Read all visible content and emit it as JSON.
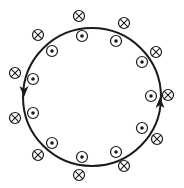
{
  "diagram": {
    "loop": {
      "cx": 92,
      "cy": 97,
      "r": 69,
      "color": "#1a1a1a"
    },
    "arrows": [
      {
        "x": 24,
        "y": 91,
        "direction": "down"
      },
      {
        "x": 160,
        "y": 103,
        "direction": "up"
      }
    ],
    "field_out_of_page": [
      {
        "x": 82,
        "y": 36
      },
      {
        "x": 116,
        "y": 41
      },
      {
        "x": 52,
        "y": 51
      },
      {
        "x": 142,
        "y": 62
      },
      {
        "x": 33,
        "y": 79
      },
      {
        "x": 151,
        "y": 96
      },
      {
        "x": 33,
        "y": 113
      },
      {
        "x": 142,
        "y": 128
      },
      {
        "x": 52,
        "y": 143
      },
      {
        "x": 116,
        "y": 152
      },
      {
        "x": 82,
        "y": 157
      }
    ],
    "field_into_page": [
      {
        "x": 79,
        "y": 16
      },
      {
        "x": 124,
        "y": 23
      },
      {
        "x": 38,
        "y": 35
      },
      {
        "x": 156,
        "y": 52
      },
      {
        "x": 15,
        "y": 73
      },
      {
        "x": 168,
        "y": 95
      },
      {
        "x": 15,
        "y": 118
      },
      {
        "x": 157,
        "y": 139
      },
      {
        "x": 38,
        "y": 155
      },
      {
        "x": 124,
        "y": 166
      },
      {
        "x": 79,
        "y": 175
      }
    ],
    "marker_radius": 5.5,
    "ink_color": "#1a1a1a"
  }
}
